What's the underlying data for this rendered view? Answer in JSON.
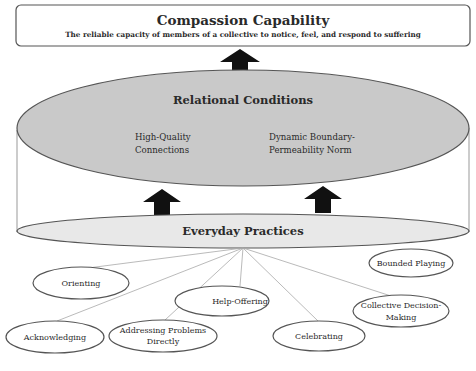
{
  "diagram": {
    "top_box": {
      "title": "Compassion Capability",
      "subtitle": "The reliable capacity of members of a collective to notice, feel, and respond to suffering"
    },
    "relational_conditions": {
      "title": "Relational Conditions",
      "items": [
        {
          "line1": "High-Quality",
          "line2": "Connections"
        },
        {
          "line1": "Dynamic Boundary-",
          "line2": "Permeability Norm"
        }
      ]
    },
    "everyday_practices": {
      "title": "Everyday Practices",
      "practices": [
        {
          "line1": "Orienting",
          "line2": ""
        },
        {
          "line1": "Acknowledging",
          "line2": ""
        },
        {
          "line1": "Addressing Problems",
          "line2": "Directly"
        },
        {
          "line1": "Help-Offering",
          "line2": ""
        },
        {
          "line1": "Celebrating",
          "line2": ""
        },
        {
          "line1": "Collective Decision-",
          "line2": "Making"
        },
        {
          "line1": "Bounded Playing",
          "line2": ""
        }
      ]
    },
    "colors": {
      "relational_fill": "#c9c9c9",
      "practices_fill": "#e8e8e8",
      "stroke": "#555555",
      "arrow": "#111111",
      "connector": "#a8a8a8"
    }
  }
}
